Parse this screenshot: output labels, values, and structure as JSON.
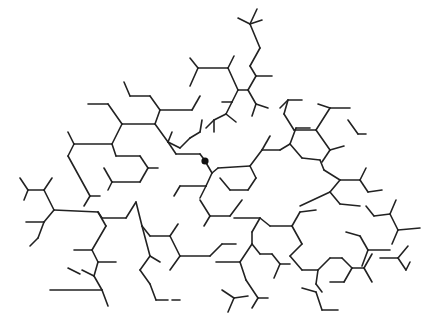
{
  "diagram": {
    "type": "hexagonal-lattice-branching-network",
    "stroke_color": "#222222",
    "background": "#ffffff",
    "marked_node": {
      "x": 205,
      "y": 161,
      "r": 3.6,
      "color": "#111111"
    },
    "segments": [
      [
        238,
        18,
        250,
        24
      ],
      [
        250,
        24,
        262,
        20
      ],
      [
        250,
        24,
        257,
        9
      ],
      [
        250,
        24,
        260,
        48
      ],
      [
        260,
        48,
        250,
        66
      ],
      [
        250,
        66,
        256,
        76
      ],
      [
        256,
        76,
        272,
        76
      ],
      [
        256,
        76,
        248,
        90
      ],
      [
        248,
        90,
        238,
        90
      ],
      [
        248,
        90,
        256,
        104
      ],
      [
        256,
        104,
        268,
        108
      ],
      [
        256,
        104,
        252,
        116
      ],
      [
        190,
        58,
        198,
        68
      ],
      [
        198,
        68,
        190,
        86
      ],
      [
        198,
        68,
        228,
        68
      ],
      [
        228,
        68,
        234,
        56
      ],
      [
        228,
        68,
        238,
        90
      ],
      [
        238,
        90,
        232,
        102
      ],
      [
        232,
        102,
        222,
        102
      ],
      [
        232,
        102,
        226,
        114
      ],
      [
        226,
        114,
        236,
        122
      ],
      [
        226,
        114,
        214,
        120
      ],
      [
        214,
        120,
        214,
        132
      ],
      [
        214,
        120,
        206,
        128
      ],
      [
        124,
        82,
        130,
        96
      ],
      [
        130,
        96,
        150,
        96
      ],
      [
        150,
        96,
        160,
        110
      ],
      [
        160,
        110,
        192,
        110
      ],
      [
        192,
        110,
        200,
        96
      ],
      [
        160,
        110,
        155,
        124
      ],
      [
        155,
        124,
        122,
        124
      ],
      [
        122,
        124,
        108,
        104
      ],
      [
        108,
        104,
        88,
        104
      ],
      [
        122,
        124,
        112,
        144
      ],
      [
        112,
        144,
        74,
        144
      ],
      [
        74,
        144,
        68,
        132
      ],
      [
        74,
        144,
        68,
        156
      ],
      [
        68,
        156,
        90,
        196
      ],
      [
        90,
        196,
        100,
        196
      ],
      [
        90,
        196,
        84,
        206
      ],
      [
        155,
        124,
        168,
        142
      ],
      [
        168,
        142,
        180,
        148
      ],
      [
        168,
        142,
        172,
        132
      ],
      [
        168,
        142,
        176,
        154
      ],
      [
        176,
        154,
        200,
        154
      ],
      [
        200,
        154,
        206,
        162
      ],
      [
        180,
        148,
        190,
        138
      ],
      [
        190,
        138,
        200,
        132
      ],
      [
        200,
        132,
        202,
        120
      ],
      [
        112,
        144,
        116,
        156
      ],
      [
        116,
        156,
        140,
        156
      ],
      [
        140,
        156,
        148,
        168
      ],
      [
        148,
        168,
        140,
        182
      ],
      [
        140,
        182,
        112,
        182
      ],
      [
        112,
        182,
        108,
        190
      ],
      [
        148,
        168,
        158,
        168
      ],
      [
        112,
        182,
        104,
        168
      ],
      [
        205,
        161,
        212,
        173
      ],
      [
        212,
        173,
        218,
        168
      ],
      [
        212,
        173,
        206,
        186
      ],
      [
        206,
        186,
        180,
        186
      ],
      [
        180,
        186,
        174,
        196
      ],
      [
        206,
        186,
        200,
        198
      ],
      [
        218,
        168,
        250,
        166
      ],
      [
        250,
        166,
        262,
        150
      ],
      [
        262,
        150,
        280,
        150
      ],
      [
        250,
        166,
        256,
        178
      ],
      [
        256,
        178,
        248,
        190
      ],
      [
        248,
        190,
        230,
        190
      ],
      [
        230,
        190,
        220,
        178
      ],
      [
        262,
        150,
        270,
        136
      ],
      [
        280,
        150,
        290,
        144
      ],
      [
        290,
        144,
        296,
        128
      ],
      [
        296,
        128,
        310,
        128
      ],
      [
        290,
        144,
        302,
        158
      ],
      [
        280,
        108,
        288,
        100
      ],
      [
        288,
        100,
        302,
        100
      ],
      [
        288,
        100,
        284,
        114
      ],
      [
        284,
        114,
        294,
        130
      ],
      [
        318,
        104,
        330,
        108
      ],
      [
        330,
        108,
        350,
        108
      ],
      [
        330,
        108,
        316,
        130
      ],
      [
        316,
        130,
        294,
        130
      ],
      [
        316,
        130,
        330,
        150
      ],
      [
        330,
        150,
        344,
        146
      ],
      [
        330,
        150,
        322,
        162
      ],
      [
        348,
        120,
        358,
        134
      ],
      [
        358,
        134,
        366,
        134
      ],
      [
        302,
        158,
        320,
        160
      ],
      [
        320,
        160,
        324,
        170
      ],
      [
        324,
        170,
        340,
        180
      ],
      [
        340,
        180,
        360,
        180
      ],
      [
        340,
        180,
        330,
        192
      ],
      [
        330,
        192,
        340,
        204
      ],
      [
        340,
        204,
        360,
        206
      ],
      [
        360,
        180,
        366,
        168
      ],
      [
        360,
        180,
        368,
        192
      ],
      [
        368,
        192,
        382,
        190
      ],
      [
        330,
        192,
        300,
        206
      ],
      [
        20,
        178,
        28,
        190
      ],
      [
        28,
        190,
        44,
        190
      ],
      [
        44,
        190,
        52,
        178
      ],
      [
        28,
        190,
        24,
        200
      ],
      [
        44,
        190,
        54,
        210
      ],
      [
        54,
        210,
        98,
        212
      ],
      [
        54,
        210,
        44,
        222
      ],
      [
        44,
        222,
        26,
        222
      ],
      [
        44,
        222,
        38,
        238
      ],
      [
        38,
        238,
        30,
        246
      ],
      [
        98,
        212,
        102,
        218
      ],
      [
        102,
        218,
        126,
        218
      ],
      [
        126,
        218,
        136,
        202
      ],
      [
        98,
        212,
        106,
        226
      ],
      [
        106,
        226,
        92,
        250
      ],
      [
        92,
        250,
        74,
        250
      ],
      [
        92,
        250,
        98,
        262
      ],
      [
        98,
        262,
        116,
        262
      ],
      [
        98,
        262,
        94,
        276
      ],
      [
        94,
        276,
        82,
        270
      ],
      [
        94,
        276,
        102,
        290
      ],
      [
        102,
        290,
        50,
        290
      ],
      [
        102,
        290,
        108,
        306
      ],
      [
        68,
        268,
        80,
        274
      ],
      [
        136,
        202,
        142,
        226
      ],
      [
        142,
        226,
        150,
        236
      ],
      [
        150,
        236,
        170,
        236
      ],
      [
        170,
        236,
        178,
        224
      ],
      [
        170,
        236,
        180,
        256
      ],
      [
        180,
        256,
        170,
        270
      ],
      [
        180,
        256,
        210,
        256
      ],
      [
        210,
        256,
        222,
        244
      ],
      [
        222,
        244,
        236,
        244
      ],
      [
        142,
        226,
        150,
        256
      ],
      [
        150,
        256,
        160,
        262
      ],
      [
        150,
        256,
        140,
        270
      ],
      [
        140,
        270,
        150,
        284
      ],
      [
        150,
        284,
        156,
        300
      ],
      [
        156,
        300,
        168,
        300
      ],
      [
        200,
        200,
        210,
        216
      ],
      [
        210,
        216,
        230,
        216
      ],
      [
        210,
        216,
        204,
        226
      ],
      [
        230,
        216,
        242,
        200
      ],
      [
        234,
        218,
        260,
        218
      ],
      [
        260,
        218,
        270,
        226
      ],
      [
        270,
        226,
        292,
        226
      ],
      [
        292,
        226,
        300,
        212
      ],
      [
        300,
        212,
        316,
        210
      ],
      [
        292,
        226,
        302,
        244
      ],
      [
        302,
        244,
        290,
        256
      ],
      [
        260,
        218,
        252,
        232
      ],
      [
        252,
        232,
        252,
        244
      ],
      [
        252,
        244,
        260,
        254
      ],
      [
        252,
        244,
        240,
        262
      ],
      [
        240,
        262,
        216,
        262
      ],
      [
        240,
        262,
        246,
        280
      ],
      [
        260,
        254,
        272,
        254
      ],
      [
        272,
        254,
        280,
        264
      ],
      [
        280,
        264,
        290,
        264
      ],
      [
        280,
        264,
        274,
        278
      ],
      [
        290,
        256,
        302,
        270
      ],
      [
        302,
        270,
        318,
        270
      ],
      [
        318,
        270,
        330,
        258
      ],
      [
        318,
        270,
        316,
        284
      ],
      [
        316,
        284,
        322,
        292
      ],
      [
        330,
        258,
        342,
        258
      ],
      [
        342,
        258,
        352,
        268
      ],
      [
        352,
        268,
        364,
        268
      ],
      [
        352,
        268,
        344,
        282
      ],
      [
        344,
        282,
        330,
        282
      ],
      [
        364,
        268,
        372,
        254
      ],
      [
        364,
        268,
        372,
        282
      ],
      [
        366,
        206,
        374,
        216
      ],
      [
        374,
        216,
        390,
        214
      ],
      [
        390,
        214,
        396,
        200
      ],
      [
        390,
        214,
        398,
        230
      ],
      [
        398,
        230,
        420,
        228
      ],
      [
        398,
        230,
        392,
        244
      ],
      [
        346,
        232,
        360,
        236
      ],
      [
        360,
        236,
        368,
        250
      ],
      [
        368,
        250,
        390,
        250
      ],
      [
        368,
        250,
        362,
        266
      ],
      [
        380,
        258,
        398,
        258
      ],
      [
        398,
        258,
        408,
        246
      ],
      [
        398,
        258,
        406,
        270
      ],
      [
        406,
        270,
        410,
        262
      ],
      [
        302,
        288,
        316,
        292
      ],
      [
        316,
        292,
        322,
        310
      ],
      [
        322,
        310,
        338,
        310
      ],
      [
        246,
        280,
        258,
        298
      ],
      [
        258,
        298,
        268,
        298
      ],
      [
        258,
        298,
        252,
        308
      ],
      [
        222,
        290,
        234,
        298
      ],
      [
        234,
        298,
        248,
        296
      ],
      [
        234,
        298,
        228,
        312
      ],
      [
        172,
        300,
        180,
        300
      ]
    ]
  }
}
